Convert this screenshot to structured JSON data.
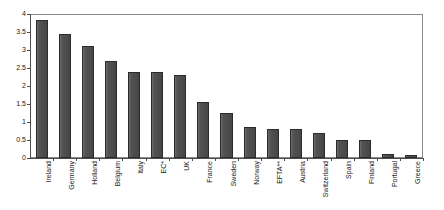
{
  "chart_data": {
    "type": "bar",
    "title": "",
    "subtitle": "",
    "xlabel": "",
    "ylabel": "",
    "ylim": [
      0,
      4
    ],
    "ytick_values": [
      0,
      0.5,
      1,
      1.5,
      2,
      2.5,
      3,
      3.5,
      4
    ],
    "ytick_labels": [
      "0",
      "0.5",
      "1",
      "1.5",
      "2",
      "2.5",
      "3",
      "3.5",
      "4"
    ],
    "grid": false,
    "legend": false,
    "bar_color": "#4a4a4a",
    "bar_edge_color": "#2b2b2b",
    "categories": [
      "Ireland",
      "Germany",
      "Holland",
      "Belgium",
      "Italy",
      "EC*",
      "UK",
      "France",
      "Sweden",
      "Norway",
      "EFTA**",
      "Austria",
      "Switzerland",
      "Spain",
      "Finland",
      "Portugal",
      "Greece"
    ],
    "values": [
      3.83,
      3.45,
      3.1,
      2.7,
      2.4,
      2.4,
      2.3,
      1.55,
      1.25,
      0.85,
      0.8,
      0.8,
      0.7,
      0.5,
      0.5,
      0.1,
      0.08
    ],
    "annotations": []
  }
}
